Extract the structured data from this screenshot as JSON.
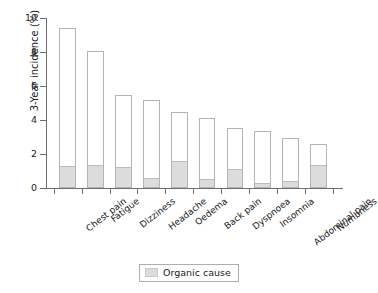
{
  "chart_data": {
    "type": "bar",
    "title": "",
    "xlabel": "",
    "ylabel": "3-Year incidence (%)",
    "ylim": [
      0,
      10
    ],
    "yticks": [
      0,
      2,
      4,
      6,
      8,
      10
    ],
    "grid": false,
    "legend_position": "bottom-center",
    "categories": [
      "Chest pain",
      "Fatigue",
      "Dizziness",
      "Headache",
      "Oedema",
      "Back pain",
      "Dyspnoea",
      "Insomnia",
      "Abdominal pain",
      "Numbness"
    ],
    "series": [
      {
        "name": "Total incidence",
        "values": [
          9.4,
          8.05,
          5.45,
          5.15,
          4.45,
          4.1,
          3.55,
          3.35,
          2.95,
          2.6
        ]
      },
      {
        "name": "Organic cause",
        "values": [
          1.25,
          1.3,
          1.15,
          0.55,
          1.55,
          0.45,
          1.05,
          0.25,
          0.35,
          1.3
        ]
      }
    ]
  },
  "legend": {
    "items": [
      {
        "label": "Organic cause",
        "color": "#dcdcdc"
      }
    ]
  },
  "colors": {
    "bar_fill": "#ffffff",
    "bar_border": "#b4b4b4",
    "organic_fill": "#dcdcdc",
    "axis": "#6e6e6e",
    "text": "#1a1a1a"
  }
}
